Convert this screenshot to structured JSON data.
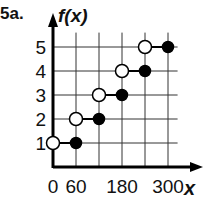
{
  "problem_label": "5a.",
  "chart_data": {
    "type": "scatter",
    "subtype": "step-function",
    "title": "",
    "xlabel": "x",
    "ylabel": "f(x)",
    "x_tick_labels": [
      "0",
      "60",
      "180",
      "300"
    ],
    "x_gridlines": [
      0,
      60,
      120,
      180,
      240,
      300
    ],
    "y_tick_labels": [
      "1",
      "2",
      "3",
      "4",
      "5"
    ],
    "xlim": [
      0,
      330
    ],
    "ylim": [
      0,
      5.6
    ],
    "grid": true,
    "legend": null,
    "segments": [
      {
        "y": 1,
        "x_start": 0,
        "x_end": 60,
        "start": "open",
        "end": "closed"
      },
      {
        "y": 2,
        "x_start": 60,
        "x_end": 120,
        "start": "open",
        "end": "closed"
      },
      {
        "y": 3,
        "x_start": 120,
        "x_end": 180,
        "start": "open",
        "end": "closed"
      },
      {
        "y": 4,
        "x_start": 180,
        "x_end": 240,
        "start": "open",
        "end": "closed"
      },
      {
        "y": 5,
        "x_start": 240,
        "x_end": 300,
        "start": "open",
        "end": "closed"
      }
    ]
  }
}
